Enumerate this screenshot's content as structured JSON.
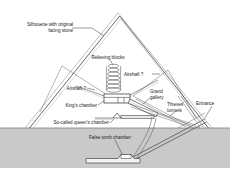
{
  "figure": {
    "kind": "cross-section-diagram",
    "background_color": "#ffffff",
    "ground_fill_color": "#c9c9c9",
    "line_color": "#333333",
    "silhouette_color": "#8d8d8d"
  },
  "labels": {
    "silhouette": "Silhouette with original",
    "silhouette_line2": "facing stone",
    "relieving_blocks": "Relieving blocks",
    "airshaft_right": "Airshaft ?",
    "airshaft_left": "Airshaft ?",
    "grand_gallery_line1": "Grand",
    "grand_gallery_line2": "gallery",
    "thieves_line1": "Thieves'",
    "thieves_line2": "tunnels",
    "entrance": "Entrance",
    "kings_chamber": "King's chamber",
    "queens_chamber": "So-called queen's chamber",
    "false_tomb_chamber": "False tomb chamber"
  },
  "geometry": {
    "apex_x": 118,
    "apex_y": 13,
    "base_left_x": 25,
    "base_right_x": 212,
    "ground_y": 128,
    "ground_bottom_y": 168,
    "relieving_block_count": 7
  }
}
